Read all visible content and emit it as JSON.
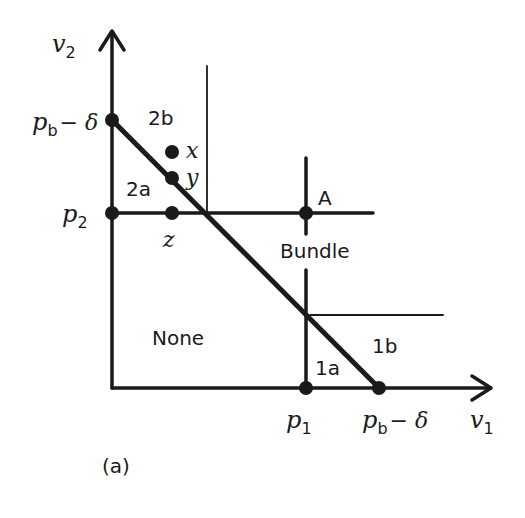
{
  "figure": {
    "caption": "(a)",
    "axes": {
      "x_label": "v",
      "x_sub": "1",
      "y_label": "v",
      "y_sub": "2"
    },
    "ticks": {
      "y_top": {
        "main": "p",
        "sub": "b",
        "rest": "− δ"
      },
      "y_p2": {
        "main": "p",
        "sub": "2"
      },
      "x_p1": {
        "main": "p",
        "sub": "1"
      },
      "x_right": {
        "main": "p",
        "sub": "b",
        "rest": "− δ"
      }
    },
    "regions": {
      "r2b": "2b",
      "r2a": "2a",
      "bundle": "Bundle",
      "none": "None",
      "r1a": "1a",
      "r1b": "1b"
    },
    "points": {
      "x": "x",
      "y": "y",
      "z": "z",
      "A": "A"
    },
    "colors": {
      "ink": "#1a1a1a",
      "background": "#ffffff"
    }
  }
}
